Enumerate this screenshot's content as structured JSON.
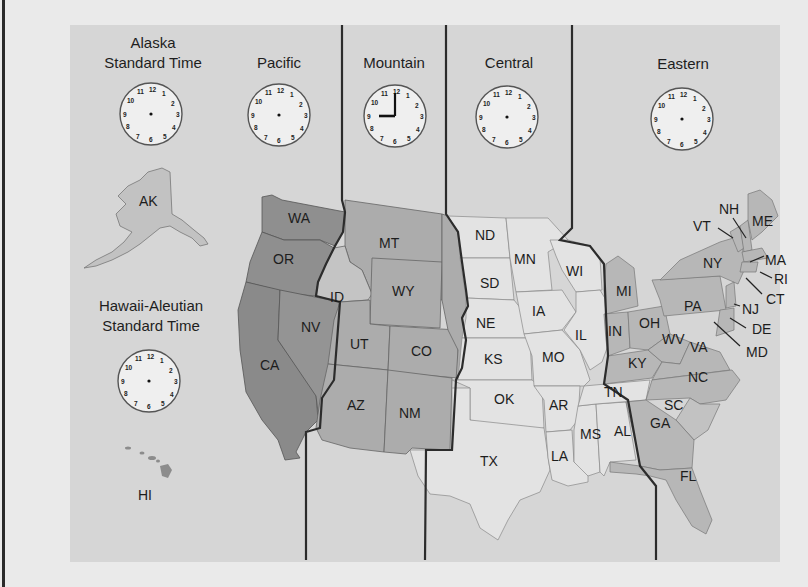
{
  "map": {
    "title": "U.S. Time Zones",
    "zones": [
      {
        "id": "alaska",
        "label_line1": "Alaska",
        "label_line2": "Standard Time",
        "clock": {
          "hour": null,
          "minute": null,
          "hands_shown": false
        },
        "shade": "#c7c7c7"
      },
      {
        "id": "pacific",
        "label_line1": "Pacific",
        "label_line2": "",
        "clock": {
          "hour": null,
          "minute": null,
          "hands_shown": false
        },
        "shade": "#8f8f8f"
      },
      {
        "id": "mountain",
        "label_line1": "Mountain",
        "label_line2": "",
        "clock": {
          "hour": 9,
          "minute": 0,
          "hands_shown": true,
          "display": "9:00"
        },
        "shade": "#acacac"
      },
      {
        "id": "central",
        "label_line1": "Central",
        "label_line2": "",
        "clock": {
          "hour": null,
          "minute": null,
          "hands_shown": false
        },
        "shade": "#e3e3e3"
      },
      {
        "id": "eastern",
        "label_line1": "Eastern",
        "label_line2": "",
        "clock": {
          "hour": null,
          "minute": null,
          "hands_shown": false
        },
        "shade": "#b7b7b7"
      },
      {
        "id": "hawaii",
        "label_line1": "Hawaii-Aleutian",
        "label_line2": "Standard Time",
        "clock": {
          "hour": null,
          "minute": null,
          "hands_shown": false
        },
        "shade": "#9a9a9a"
      }
    ],
    "clock_numbers": [
      "12",
      "1",
      "2",
      "3",
      "4",
      "5",
      "6",
      "7",
      "8",
      "9",
      "10",
      "11"
    ],
    "states": {
      "alaska": [
        "AK"
      ],
      "hawaii": [
        "HI"
      ],
      "pacific": [
        "WA",
        "OR",
        "NV",
        "CA"
      ],
      "mountain": [
        "MT",
        "ID",
        "WY",
        "UT",
        "CO",
        "AZ",
        "NM"
      ],
      "central": [
        "ND",
        "SD",
        "NE",
        "KS",
        "OK",
        "TX",
        "MN",
        "IA",
        "MO",
        "AR",
        "LA",
        "WI",
        "IL",
        "MS",
        "AL",
        "TN"
      ],
      "eastern": [
        "MI",
        "IN",
        "OH",
        "KY",
        "WV",
        "VA",
        "PA",
        "NY",
        "VT",
        "NH",
        "ME",
        "MA",
        "RI",
        "CT",
        "NJ",
        "DE",
        "MD",
        "NC",
        "SC",
        "GA",
        "FL"
      ]
    },
    "labels": {
      "AK": "AK",
      "HI": "HI",
      "WA": "WA",
      "OR": "OR",
      "NV": "NV",
      "CA": "CA",
      "MT": "MT",
      "ID": "ID",
      "WY": "WY",
      "UT": "UT",
      "CO": "CO",
      "AZ": "AZ",
      "NM": "NM",
      "ND": "ND",
      "SD": "SD",
      "NE": "NE",
      "KS": "KS",
      "OK": "OK",
      "TX": "TX",
      "MN": "MN",
      "IA": "IA",
      "MO": "MO",
      "AR": "AR",
      "LA": "LA",
      "WI": "WI",
      "IL": "IL",
      "MS": "MS",
      "AL": "AL",
      "TN": "TN",
      "MI": "MI",
      "IN": "IN",
      "OH": "OH",
      "KY": "KY",
      "WV": "WV",
      "VA": "VA",
      "PA": "PA",
      "NY": "NY",
      "VT": "VT",
      "NH": "NH",
      "ME": "ME",
      "MA": "MA",
      "RI": "RI",
      "CT": "CT",
      "NJ": "NJ",
      "DE": "DE",
      "MD": "MD",
      "NC": "NC",
      "SC": "SC",
      "GA": "GA",
      "FL": "FL"
    },
    "colors": {
      "background": "#d6d6d6",
      "page": "#eaeaea",
      "divider": "#333333",
      "pacific": "#8f8f8f",
      "mountain": "#acacac",
      "central": "#e3e3e3",
      "eastern": "#b7b7b7",
      "alaska": "#c2c2c2"
    }
  }
}
